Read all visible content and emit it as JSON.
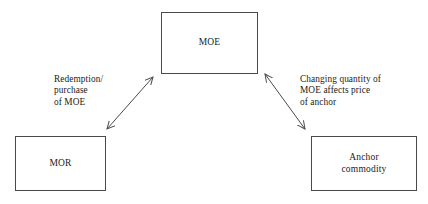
{
  "diagram": {
    "background_color": "#ffffff",
    "stroke_color": "#4a4a4a",
    "text_color": "#1a1a1a",
    "nodes": [
      {
        "id": "moe",
        "label": "MOE",
        "x": 161,
        "y": 12,
        "width": 97,
        "height": 62
      },
      {
        "id": "mor",
        "label": "MOR",
        "x": 15,
        "y": 136,
        "width": 91,
        "height": 55
      },
      {
        "id": "anchor",
        "label": "Anchor\ncommodity",
        "x": 311,
        "y": 136,
        "width": 106,
        "height": 55
      }
    ],
    "edges": [
      {
        "id": "edge-mor-moe",
        "label": "Redemption/\npurchase\nof MOE",
        "from": "mor",
        "to": "moe",
        "arrowheads": "both",
        "x1": 107,
        "y1": 129,
        "x2": 153,
        "y2": 77
      },
      {
        "id": "edge-moe-anchor",
        "label": "Changing quantity of\nMOE affects price\nof anchor",
        "from": "moe",
        "to": "anchor",
        "arrowheads": "both",
        "x1": 265,
        "y1": 74,
        "x2": 305,
        "y2": 129
      }
    ]
  }
}
